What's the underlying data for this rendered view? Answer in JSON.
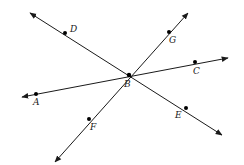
{
  "diagram": {
    "type": "intersecting-lines",
    "colors": {
      "line": "#1a1a1a",
      "point": "#000000",
      "background": "#ffffff"
    },
    "center": {
      "name": "B",
      "x": 129,
      "y": 75,
      "label_x": 124,
      "label_y": 87
    },
    "lines": [
      {
        "id": "line-DE",
        "through": [
          "D",
          "B",
          "E"
        ],
        "start": [
          30,
          13
        ],
        "end": [
          222,
          135
        ]
      },
      {
        "id": "line-GF",
        "through": [
          "G",
          "B",
          "F"
        ],
        "start": [
          188,
          13
        ],
        "end": [
          55,
          162
        ]
      },
      {
        "id": "line-AC",
        "through": [
          "A",
          "B",
          "C"
        ],
        "start": [
          22,
          97
        ],
        "end": [
          228,
          58
        ]
      }
    ],
    "points": [
      {
        "name": "D",
        "x": 65,
        "y": 33,
        "label_x": 70,
        "label_y": 32
      },
      {
        "name": "G",
        "x": 169,
        "y": 32,
        "label_x": 169,
        "label_y": 43
      },
      {
        "name": "C",
        "x": 195,
        "y": 62,
        "label_x": 193,
        "label_y": 74
      },
      {
        "name": "A",
        "x": 36,
        "y": 94,
        "label_x": 33,
        "label_y": 105
      },
      {
        "name": "F",
        "x": 89,
        "y": 119,
        "label_x": 90,
        "label_y": 130
      },
      {
        "name": "E",
        "x": 186,
        "y": 108,
        "label_x": 175,
        "label_y": 118
      }
    ]
  }
}
